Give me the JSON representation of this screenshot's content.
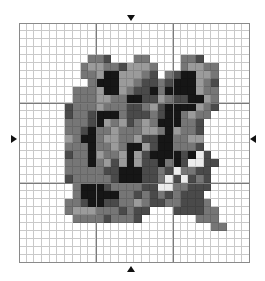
{
  "pattern": {
    "columns": 30,
    "rows": 30,
    "major_every": 10,
    "palette": {
      "0": "#ffffff",
      "1": "#9b9b9b",
      "2": "#767676",
      "3": "#4a4a4a",
      "4": "#161616",
      "5": "#ececec"
    },
    "grid_line_color": "#c9c9c9",
    "major_line_color": "#7a7a7a",
    "cells": [
      "000000000000000000000000000000",
      "000000000000000000000000000000",
      "000000000000000000000000000000",
      "000000000000000000000000000000",
      "000000000223000220000223000000",
      "000000002112231112000211220000",
      "000000002214411123023441120000",
      "000000000244411233234441230000",
      "000000022214412334244441220000",
      "000000022211224433123344120000",
      "000000322212223321344441230000",
      "000000322344423332344212200000",
      "000000222341213212444223000000",
      "000000223422122211241223000000",
      "000000124421122133442211000000",
      "000000222422124413442223000000",
      "000000322412214134444345300000",
      "000000222421314133424355330000",
      "000000222223344433235223300000",
      "000000322222344433253532300000",
      "000000024443222233552233300000",
      "000000024444422323232333000000",
      "000000223443322123322333200000",
      "000000211122232330003333220000",
      "000000022223222300000002220000",
      "000000000000000000000000022000",
      "000000000000000000000000000000",
      "000000000000000000000000000000",
      "000000000000000000000000000000",
      "000000000000000000000000000000"
    ]
  },
  "markers": {
    "top": "center-column-marker",
    "bottom": "center-column-marker",
    "left": "center-row-marker",
    "right": "center-row-marker"
  }
}
